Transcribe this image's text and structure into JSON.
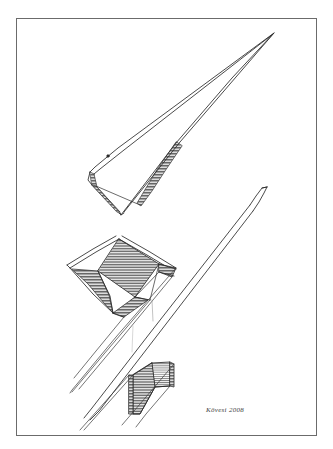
{
  "artwork": {
    "title": "Untitled pen-and-ink geometric study",
    "medium": "pen and ink on paper",
    "background_color": "#ffffff",
    "ink_color": "#2b2b2b",
    "hatch_color": "#6e6e6e",
    "frame": {
      "name": "paper-border",
      "color": "#6b6b6b",
      "x": 16,
      "y": 18,
      "width": 301,
      "height": 418,
      "stroke_width": 1
    },
    "signature": {
      "text": "Kövesi 2008",
      "x": 206,
      "y": 411,
      "color": "#3c3c3c"
    },
    "forms": [
      {
        "name": "upper-blade-form",
        "description": "long tapering triangular blade pointing up-right, open outline with hatched inner edge",
        "apex_x": 273,
        "apex_y": 33
      },
      {
        "name": "middle-folded-form",
        "description": "folded quadrilateral panel with dense horizontal hatching and two tapering fins",
        "center_x": 120,
        "center_y": 270
      },
      {
        "name": "right-spear-form",
        "description": "slender elongated spear shape descending from upper right to lower left",
        "tip_x": 268,
        "tip_y": 186
      },
      {
        "name": "lower-hatched-block",
        "description": "small stepped block with horizontal hatching near the lower centre",
        "center_x": 155,
        "center_y": 385
      },
      {
        "name": "sweeping-guide-lines",
        "description": "long straight ruled lines sweeping diagonally across the lower half"
      }
    ]
  }
}
